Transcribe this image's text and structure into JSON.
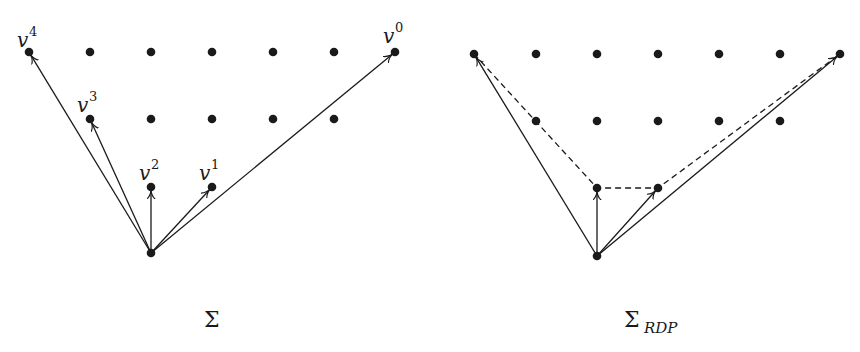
{
  "figure": {
    "panels": [
      {
        "id": "sigma",
        "caption": {
          "main": "Σ",
          "sub": ""
        },
        "origin": [
          151,
          253
        ],
        "grid_dots": [
          [
            29,
            52
          ],
          [
            90,
            52
          ],
          [
            151,
            52
          ],
          [
            212,
            52
          ],
          [
            273,
            52
          ],
          [
            334,
            52
          ],
          [
            395,
            52
          ],
          [
            90,
            119
          ],
          [
            151,
            119
          ],
          [
            212,
            119
          ],
          [
            273,
            119
          ],
          [
            334,
            119
          ],
          [
            151,
            187
          ],
          [
            212,
            187
          ]
        ],
        "vectors": [
          {
            "name": "v",
            "index": "0",
            "to": [
              395,
              52
            ]
          },
          {
            "name": "v",
            "index": "1",
            "to": [
              212,
              187
            ]
          },
          {
            "name": "v",
            "index": "2",
            "to": [
              151,
              187
            ]
          },
          {
            "name": "v",
            "index": "3",
            "to": [
              90,
              119
            ]
          },
          {
            "name": "v",
            "index": "4",
            "to": [
              29,
              52
            ]
          }
        ],
        "dashed_path": []
      },
      {
        "id": "sigma-rdp",
        "caption": {
          "main": "Σ",
          "sub": "RDP"
        },
        "origin": [
          597,
          256
        ],
        "grid_dots": [
          [
            474,
            54
          ],
          [
            536,
            54
          ],
          [
            597,
            54
          ],
          [
            658,
            54
          ],
          [
            719,
            54
          ],
          [
            780,
            54
          ],
          [
            840,
            54
          ],
          [
            536,
            121
          ],
          [
            597,
            121
          ],
          [
            658,
            121
          ],
          [
            719,
            121
          ],
          [
            780,
            121
          ],
          [
            597,
            188
          ],
          [
            658,
            188
          ]
        ],
        "vectors": [
          {
            "to": [
              840,
              54
            ]
          },
          {
            "to": [
              658,
              188
            ]
          },
          {
            "to": [
              597,
              188
            ]
          },
          {
            "to": [
              474,
              54
            ]
          }
        ],
        "dashed_path": [
          [
            474,
            54
          ],
          [
            597,
            188
          ],
          [
            658,
            188
          ],
          [
            840,
            54
          ]
        ]
      }
    ],
    "labels": [
      {
        "base": "v",
        "sup": "4",
        "x": 17,
        "y": 47,
        "sx": 29,
        "sy": 36
      },
      {
        "base": "v",
        "sup": "3",
        "x": 77,
        "y": 112,
        "sx": 89,
        "sy": 101
      },
      {
        "base": "v",
        "sup": "2",
        "x": 139,
        "y": 180,
        "sx": 151,
        "sy": 169
      },
      {
        "base": "v",
        "sup": "1",
        "x": 199,
        "y": 180,
        "sx": 211,
        "sy": 169
      },
      {
        "base": "v",
        "sup": "0",
        "x": 383,
        "y": 43,
        "sx": 395,
        "sy": 32
      }
    ],
    "captions": [
      {
        "main": "Σ",
        "sub": "",
        "x": 204,
        "y": 327
      },
      {
        "main": "Σ",
        "sub": "RDP",
        "x": 624,
        "y": 327,
        "subx": 644,
        "suby": 333
      }
    ]
  }
}
